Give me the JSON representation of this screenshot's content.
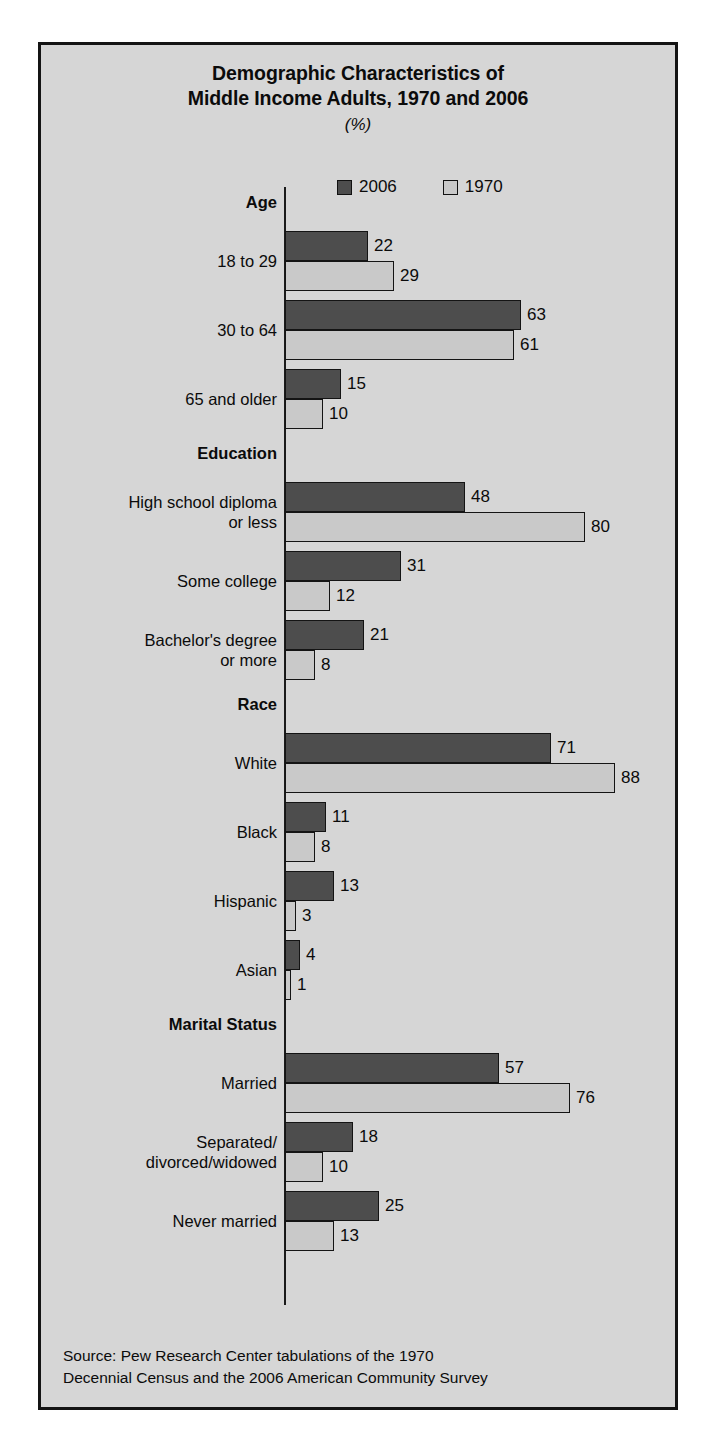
{
  "title": {
    "line1": "Demographic Characteristics of",
    "line2": "Middle Income Adults, 1970 and 2006",
    "subtitle": "(%)"
  },
  "legend": {
    "items": [
      {
        "label": "2006",
        "color": "#4d4d4d",
        "key": "2006"
      },
      {
        "label": "1970",
        "color": "#c9c9c9",
        "key": "1970"
      }
    ]
  },
  "source": {
    "line1": "Source: Pew Research Center tabulations of the 1970",
    "line2": "Decennial Census and the 2006 American Community  Survey"
  },
  "chart_data": {
    "type": "bar",
    "orientation": "horizontal",
    "title": "Demographic Characteristics of Middle Income Adults, 1970 and 2006",
    "subtitle": "(%)",
    "xlabel": "",
    "ylabel": "",
    "unit": "%",
    "xlim": [
      0,
      88
    ],
    "grid": false,
    "legend_position": "top-center",
    "series": [
      {
        "name": "2006",
        "color": "#4d4d4d"
      },
      {
        "name": "1970",
        "color": "#c9c9c9"
      }
    ],
    "sections": [
      {
        "name": "Age",
        "categories": [
          {
            "label": "18 to 29",
            "label_line2": "",
            "values": {
              "2006": 22,
              "1970": 29
            }
          },
          {
            "label": "30 to 64",
            "label_line2": "",
            "values": {
              "2006": 63,
              "1970": 61
            }
          },
          {
            "label": "65 and older",
            "label_line2": "",
            "values": {
              "2006": 15,
              "1970": 10
            }
          }
        ]
      },
      {
        "name": "Education",
        "categories": [
          {
            "label": "High school diploma",
            "label_line2": "or less",
            "values": {
              "2006": 48,
              "1970": 80
            }
          },
          {
            "label": "Some college",
            "label_line2": "",
            "values": {
              "2006": 31,
              "1970": 12
            }
          },
          {
            "label": "Bachelor's degree",
            "label_line2": "or more",
            "values": {
              "2006": 21,
              "1970": 8
            }
          }
        ]
      },
      {
        "name": "Race",
        "categories": [
          {
            "label": "White",
            "label_line2": "",
            "values": {
              "2006": 71,
              "1970": 88
            }
          },
          {
            "label": "Black",
            "label_line2": "",
            "values": {
              "2006": 11,
              "1970": 8
            }
          },
          {
            "label": "Hispanic",
            "label_line2": "",
            "values": {
              "2006": 13,
              "1970": 3
            }
          },
          {
            "label": "Asian",
            "label_line2": "",
            "values": {
              "2006": 4,
              "1970": 1
            }
          }
        ]
      },
      {
        "name": "Marital Status",
        "categories": [
          {
            "label": "Married",
            "label_line2": "",
            "values": {
              "2006": 57,
              "1970": 76
            }
          },
          {
            "label": "Separated/",
            "label_line2": "divorced/widowed",
            "values": {
              "2006": 18,
              "1970": 10
            }
          },
          {
            "label": "Never married",
            "label_line2": "",
            "values": {
              "2006": 25,
              "1970": 13
            }
          }
        ]
      }
    ]
  },
  "layout": {
    "px_per_unit": 3.75,
    "bar_height": 30,
    "group_gap": 9,
    "section_head_gap": 44,
    "plot_start_y": 22
  }
}
